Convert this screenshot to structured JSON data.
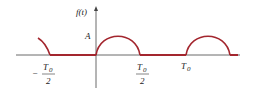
{
  "diagram": {
    "y_axis_label": "f(t)",
    "amplitude_label": "A",
    "ticks": [
      {
        "name": "neg-half-period",
        "numerator": "T",
        "sub": "0",
        "denominator": "2",
        "sign": "−"
      },
      {
        "name": "half-period",
        "numerator": "T",
        "sub": "0",
        "denominator": "2",
        "sign": ""
      },
      {
        "name": "period",
        "numerator": "T",
        "sub": "0",
        "denominator": "",
        "sign": ""
      }
    ],
    "colors": {
      "waveform": "#a3262e",
      "axis": "#444444",
      "text": "#222222"
    }
  }
}
